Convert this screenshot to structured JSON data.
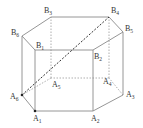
{
  "diagram": {
    "type": "hexagonal-prism",
    "vertices": {
      "A1": {
        "label": "A",
        "sub": "1"
      },
      "A2": {
        "label": "A",
        "sub": "2"
      },
      "A3": {
        "label": "A",
        "sub": "3"
      },
      "A4": {
        "label": "A",
        "sub": "4"
      },
      "A5": {
        "label": "A",
        "sub": "5"
      },
      "A6": {
        "label": "A",
        "sub": "6"
      },
      "B1": {
        "label": "B",
        "sub": "1"
      },
      "B2": {
        "label": "B",
        "sub": "2"
      },
      "B3": {
        "label": "B",
        "sub": "3"
      },
      "B4": {
        "label": "B",
        "sub": "4"
      },
      "B5": {
        "label": "B",
        "sub": "5"
      },
      "B6": {
        "label": "B",
        "sub": "6"
      }
    },
    "visible_edges": [
      [
        "B1",
        "B2"
      ],
      [
        "B2",
        "B5"
      ],
      [
        "B5",
        "B4"
      ],
      [
        "B4",
        "B3"
      ],
      [
        "B3",
        "B6"
      ],
      [
        "B6",
        "B1"
      ],
      [
        "A6",
        "A1"
      ],
      [
        "A1",
        "A2"
      ],
      [
        "A2",
        "A3"
      ],
      [
        "A1",
        "B1"
      ],
      [
        "A2",
        "B2"
      ],
      [
        "A3",
        "B5"
      ],
      [
        "A6",
        "B6"
      ]
    ],
    "hidden_edges": [
      [
        "A3",
        "A4"
      ],
      [
        "A4",
        "A5"
      ],
      [
        "A5",
        "A6"
      ],
      [
        "A4",
        "B4"
      ],
      [
        "A5",
        "B3"
      ]
    ],
    "highlighted_segment": [
      "A6",
      "B4"
    ],
    "marked_points": [
      "A6",
      "A1"
    ]
  }
}
